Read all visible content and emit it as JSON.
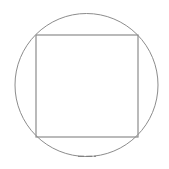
{
  "diagram": {
    "canvas": {
      "width": 169,
      "height": 169,
      "background": "#ffffff"
    },
    "circle": {
      "cx": 86.5,
      "cy": 85,
      "r": 71.5,
      "stroke": "#8c8c8c",
      "stroke_width": 1
    },
    "square": {
      "x": 36,
      "y": 35,
      "width": 102,
      "height": 102,
      "stroke": "#8c8c8c",
      "stroke_width": 1.2
    },
    "bottom_mark": {
      "x1": 78,
      "x2": 96,
      "y": 156.3,
      "stroke": "#7a7a7a",
      "dash": "6 2"
    }
  }
}
